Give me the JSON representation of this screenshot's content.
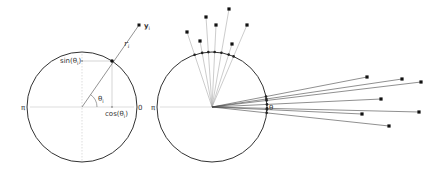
{
  "left_panel": {
    "center": [
      82,
      107
    ],
    "radius": 55,
    "point_on_circle": [
      112,
      61
    ],
    "observation": [
      139,
      25
    ],
    "labels": {
      "y": "y",
      "y_sub": "i",
      "r": "r",
      "r_sub": "i",
      "sin": "sin(θ",
      "sin_sub": "i",
      "sin_close": ")",
      "cos": "cos(θ",
      "cos_sub": "i",
      "cos_close": ")",
      "theta": "θ",
      "theta_sub": "i",
      "pi": "π",
      "zero": "0"
    }
  },
  "right_panel": {
    "center": [
      212,
      107
    ],
    "radius": 55,
    "labels": {
      "pi": "π",
      "theta": "θ"
    },
    "top_cluster_points": [
      [
        187,
        32
      ],
      [
        200,
        41
      ],
      [
        206,
        17
      ],
      [
        216,
        25
      ],
      [
        229,
        9
      ],
      [
        232,
        44
      ],
      [
        247,
        25
      ]
    ],
    "right_cluster_points": [
      [
        367,
        77
      ],
      [
        402,
        79
      ],
      [
        421,
        82
      ],
      [
        381,
        99
      ],
      [
        419,
        112
      ],
      [
        362,
        114
      ],
      [
        389,
        126
      ]
    ]
  },
  "colors": {
    "circle": "#333333",
    "line": "#666666",
    "guide": "#bbbbbb",
    "point": "#111111"
  }
}
